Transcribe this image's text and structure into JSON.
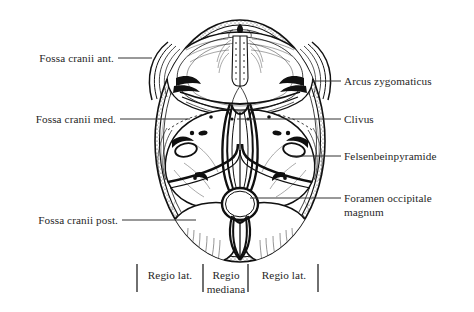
{
  "figure": {
    "type": "anatomical-line-drawing",
    "style": "black ink engraving on white",
    "colors": {
      "ink": "#111111",
      "background": "#ffffff",
      "leader": "#333333",
      "text": "#262626"
    }
  },
  "labels": {
    "left": [
      {
        "id": "fossa-cranii-ant",
        "text": "Fossa cranii ant.",
        "x": 22,
        "y": 52,
        "leader_to_x": 152,
        "leader_y": 58
      },
      {
        "id": "fossa-cranii-med",
        "text": "Fossa cranii med.",
        "x": 19,
        "y": 113,
        "leader_to_x": 190,
        "leader_y": 119
      },
      {
        "id": "fossa-cranii-post",
        "text": "Fossa cranii post.",
        "x": 24,
        "y": 214,
        "leader_to_x": 196,
        "leader_y": 220
      }
    ],
    "right": [
      {
        "id": "arcus-zygomaticus",
        "text": "Arcus zygomaticus",
        "x": 344,
        "y": 75,
        "leader_from_x": 312,
        "leader_y": 81
      },
      {
        "id": "clivus",
        "text": "Clivus",
        "x": 344,
        "y": 113,
        "leader_from_x": 237,
        "leader_y": 119
      },
      {
        "id": "felsenbeinpyramide",
        "text": "Felsenbeinpyramide",
        "x": 344,
        "y": 150,
        "leader_from_x": 290,
        "leader_y": 156
      },
      {
        "id": "foramen-occipitale-magnum",
        "text": "Foramen occipitale",
        "text2": "magnum",
        "x": 344,
        "y": 192,
        "leader_from_x": 250,
        "leader_y": 198
      }
    ],
    "bottom_scale": {
      "ticks_x": [
        137,
        203,
        248,
        318
      ],
      "tick_top": 264,
      "tick_bottom": 292,
      "segments": [
        {
          "id": "regio-lat-left",
          "text": "Regio lat.",
          "text2": "",
          "center_x": 170,
          "y": 270
        },
        {
          "id": "regio-mediana",
          "text": "Regio",
          "text2": "mediana",
          "center_x": 225,
          "y": 270
        },
        {
          "id": "regio-lat-right",
          "text": "Regio lat.",
          "text2": "",
          "center_x": 283,
          "y": 270
        }
      ]
    }
  },
  "structures": [
    {
      "id": "crista-galli",
      "label": "crista galli"
    },
    {
      "id": "lamina-cribrosa",
      "label": "cribriform plate"
    },
    {
      "id": "ala-minor",
      "label": "lesser wing of sphenoid"
    },
    {
      "id": "sella-turcica",
      "label": "sella turcica"
    },
    {
      "id": "pyramis-petrosa",
      "label": "petrous pyramid"
    },
    {
      "id": "foramen-magnum",
      "label": "foramen magnum"
    },
    {
      "id": "crista-occipitalis",
      "label": "internal occipital crest"
    },
    {
      "id": "arcus-zygomaticus-shape",
      "label": "zygomatic arch"
    }
  ]
}
